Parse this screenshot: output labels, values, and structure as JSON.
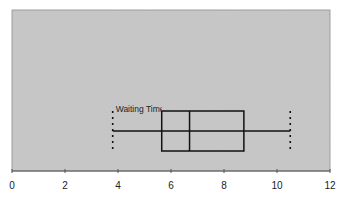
{
  "chart_data": {
    "type": "boxplot",
    "title": "",
    "xlabel": "",
    "ylabel": "",
    "xlim": [
      0,
      12
    ],
    "x_ticks": [
      0,
      2,
      4,
      6,
      8,
      10,
      12
    ],
    "grid": false,
    "orientation": "horizontal",
    "plot_background": "#c8c8c8",
    "series": [
      {
        "name": "Waiting Time",
        "min": 3.8,
        "q1": 5.65,
        "median": 6.7,
        "q3": 8.75,
        "max": 10.5
      }
    ]
  }
}
